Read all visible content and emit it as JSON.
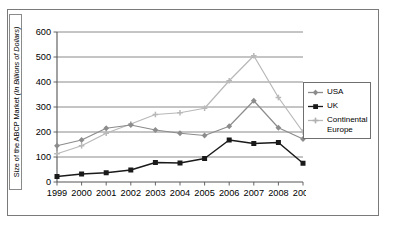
{
  "chart_data": {
    "type": "line",
    "title": "",
    "xlabel": "",
    "ylabel": "Size of the ABCP Market (In Billions of Dollars)",
    "ylabel_plain_prefix": "Size of the ABCP Market ",
    "ylabel_italic_part": "(In Billions of Dollars)",
    "categories": [
      "1999",
      "2000",
      "2001",
      "2002",
      "2003",
      "2004",
      "2005",
      "2006",
      "2007",
      "2008",
      "2009"
    ],
    "x": [
      1999,
      2000,
      2001,
      2002,
      2003,
      2004,
      2005,
      2006,
      2007,
      2008,
      2009
    ],
    "ylim": [
      0,
      600
    ],
    "yticks": [
      0,
      100,
      200,
      300,
      400,
      500,
      600
    ],
    "ytick_labels": [
      "0",
      "100",
      "200",
      "300",
      "400",
      "500",
      "600"
    ],
    "grid": "horizontal",
    "legend_position": "right",
    "series": [
      {
        "name": "USA",
        "color": "#8c8c8c",
        "marker": "diamond",
        "values": [
          145,
          168,
          215,
          228,
          208,
          195,
          186,
          223,
          325,
          217,
          172
        ]
      },
      {
        "name": "UK",
        "color": "#1a1a1a",
        "marker": "square",
        "values": [
          22,
          32,
          37,
          48,
          78,
          76,
          94,
          168,
          154,
          158,
          75
        ]
      },
      {
        "name": "Continental Europe",
        "color": "#b8b8b8",
        "marker": "cross",
        "values": [
          113,
          145,
          195,
          232,
          270,
          277,
          295,
          405,
          505,
          338,
          200
        ]
      }
    ]
  },
  "legend": {
    "items": [
      {
        "label": "USA"
      },
      {
        "label": "UK"
      },
      {
        "label": "Continental Europe"
      }
    ]
  }
}
